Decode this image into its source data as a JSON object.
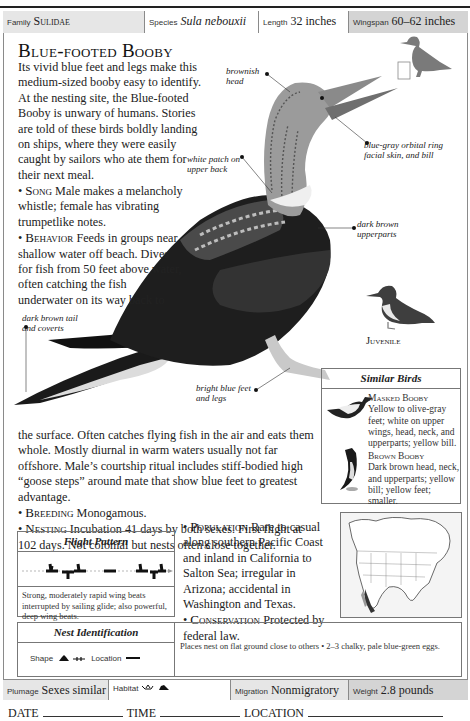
{
  "header": {
    "family": {
      "label": "Family",
      "value": "Sulidae"
    },
    "species": {
      "label": "Species",
      "value": "Sula nebouxii"
    },
    "length": {
      "label": "Length",
      "value": "32 inches"
    },
    "wingspan": {
      "label": "Wingspan",
      "value": "60–62 inches"
    }
  },
  "title": "Blue-footed Booby",
  "intro": "Its vivid blue feet and legs make this medium-sized booby easy to identify. At the nesting site, the Blue-footed Booby is unwary of humans. Stories are told of these birds boldly landing on ships, where they were easily caught by sailors who ate them for their next meal.",
  "song": {
    "label": "Song",
    "text": "Male makes a melancholy whistle; female has vibrating trumpetlike notes."
  },
  "behavior": {
    "label": "Behavior",
    "text": "Feeds in groups near shallow water off beach. Dives for fish from 50 feet above water, often catching the fish underwater on its way back to"
  },
  "behavior_cont": "the surface. Often catches flying fish in the air and eats them whole. Mostly diurnal in warm waters usually not far offshore. Male’s courtship ritual includes stiff-bodied high “goose steps” around mate that show blue feet to greatest advantage.",
  "breeding": {
    "label": "Breeding",
    "text": "Monogamous."
  },
  "nesting": {
    "label": "Nesting",
    "text": "Incubation 41 days by both sexes. First flight at 102 days. Not colonial but nests often close together."
  },
  "population": {
    "label": "Population",
    "text": "Rare to casual along southern Pacific Coast and inland in California to Salton Sea; irregular in Arizona; accidental in Washington and Texas."
  },
  "conservation": {
    "label": "Conservation",
    "text": "Protected by federal law."
  },
  "annotations": {
    "head": "brownish head",
    "bill": "blue-gray orbital ring facial skin, and bill",
    "back": "white patch on upper back",
    "upperparts": "dark brown upperparts",
    "tail": "dark brown tail and coverts",
    "feet": "bright blue feet and legs"
  },
  "juvenile_label": "Juvenile",
  "similar_birds": {
    "title": "Similar Birds",
    "items": [
      {
        "name": "Masked Booby",
        "text": "Yellow to olive-gray feet; white on upper wings, head, neck, and upperparts; yellow bill."
      },
      {
        "name": "Brown Booby",
        "text": "Dark brown head, neck, and upperparts; yellow bill; yellow feet; smaller."
      }
    ]
  },
  "flight_pattern": {
    "title": "Flight Pattern",
    "text": "Strong, moderately rapid wing beats interrupted by sailing glide; also powerful, deep wing beats."
  },
  "nest_identification": {
    "title": "Nest Identification",
    "shape_label": "Shape",
    "location_label": "Location",
    "text": "Places nest on flat ground close to others • 2–3 chalky, pale blue-green eggs."
  },
  "footer": {
    "plumage": {
      "label": "Plumage",
      "value": "Sexes similar"
    },
    "habitat": {
      "label": "Habitat",
      "value": ""
    },
    "migration": {
      "label": "Migration",
      "value": "Nonmigratory"
    },
    "weight": {
      "label": "Weight",
      "value": "2.8 pounds"
    }
  },
  "log": {
    "date": "DATE",
    "time": "TIME",
    "location": "LOCATION"
  },
  "colors": {
    "border": "#8a8a8a",
    "header_gray": "#e6e6e6",
    "header_dark": "#d4d4d4",
    "silhouette": "#7a7a7a",
    "bird_dark": "#1a1a1a"
  }
}
